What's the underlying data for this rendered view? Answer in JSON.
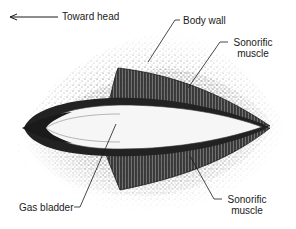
{
  "diagram": {
    "colors": {
      "ink": "#1a1a1a",
      "stipple": "#555555",
      "background": "#ffffff",
      "bladder": "#f6f6f6"
    },
    "direction_indicator": {
      "label": "Toward head",
      "arrow": "left-arrow"
    },
    "labels": {
      "body_wall": "Body wall",
      "sonorific_muscle_top_line1": "Sonorific",
      "sonorific_muscle_top_line2": "muscle",
      "gas_bladder": "Gas bladder",
      "sonorific_muscle_bottom_line1": "Sonorific",
      "sonorific_muscle_bottom_line2": "muscle"
    }
  }
}
